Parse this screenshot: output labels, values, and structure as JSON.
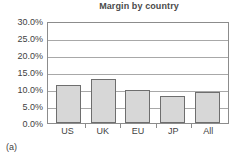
{
  "chart_data": {
    "type": "bar",
    "title": "Margin by country",
    "xlabel": "",
    "ylabel": "",
    "categories": [
      "US",
      "UK",
      "EU",
      "JP",
      "All"
    ],
    "values": [
      11.2,
      13.0,
      9.7,
      8.0,
      9.0
    ],
    "ylim": [
      0,
      30
    ],
    "ytick_values": [
      30.0,
      25.0,
      20.0,
      15.0,
      10.0,
      5.0,
      0.0
    ],
    "ytick_labels": [
      "30.0%",
      "25.0%",
      "20.0%",
      "15.0%",
      "10.0%",
      "5.0%",
      "0.0%"
    ],
    "grid": true,
    "legend": "none",
    "bar_fill": "#d7d7d7",
    "bar_border": "#6e6e6e",
    "axis_color": "#8c8c8c",
    "grid_color": "#a8a8a8"
  },
  "caption": {
    "label": "(a)"
  }
}
